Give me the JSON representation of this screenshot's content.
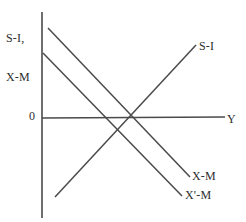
{
  "figure": {
    "background_color": "#ffffff",
    "line_color": "#4a4a4a",
    "text_color": "#2e2e2e"
  },
  "axes": {
    "vertical_label_line1": "S-I,",
    "vertical_label_line2": "X-M",
    "horizontal_label": "Y",
    "origin_label": "0"
  },
  "curves": {
    "si_label": "S-I",
    "xm_label": "X-M",
    "xprime_m_label": "X'-M"
  },
  "chart_data": {
    "type": "line",
    "title": "",
    "xlabel": "Y",
    "ylabel": "S-I, X-M",
    "xlim": [
      0,
      246
    ],
    "ylim": [
      0,
      222
    ],
    "grid": false,
    "legend": "inline-end-labels",
    "axis_lines": [
      {
        "name": "y-axis",
        "x1": 42,
        "y1": 12,
        "x2": 42,
        "y2": 218
      },
      {
        "name": "x-axis",
        "x1": 42,
        "y1": 118,
        "x2": 225,
        "y2": 117
      }
    ],
    "series": [
      {
        "name": "S-I",
        "slope": "upward",
        "points": [
          [
            55,
            197
          ],
          [
            196,
            45
          ]
        ],
        "label": "S-I",
        "label_position": [
          199,
          40
        ]
      },
      {
        "name": "X-M",
        "slope": "downward",
        "points": [
          [
            48,
            28
          ],
          [
            190,
            177
          ]
        ],
        "label": "X-M",
        "label_position": [
          192,
          170
        ]
      },
      {
        "name": "X'-M",
        "slope": "downward",
        "points": [
          [
            43,
            53
          ],
          [
            182,
            196
          ]
        ],
        "label": "X'-M",
        "label_position": [
          185,
          189
        ]
      }
    ],
    "annotations": [
      {
        "text": "0",
        "position": [
          29,
          110
        ],
        "role": "origin"
      }
    ]
  }
}
